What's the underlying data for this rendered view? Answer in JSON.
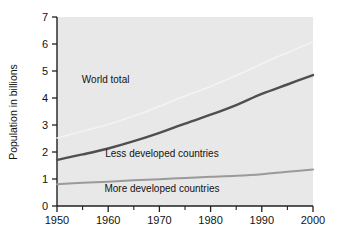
{
  "chart_data": {
    "type": "line",
    "title": "",
    "xlabel": "",
    "ylabel": "Population in billions",
    "xlim": [
      1950,
      2000
    ],
    "ylim": [
      0,
      7
    ],
    "grid": false,
    "legend_position": "inline-annotations",
    "x_tick_labels": [
      "1950",
      "1960",
      "1970",
      "1980",
      "1990",
      "2000"
    ],
    "x_major_ticks": [
      1950,
      1960,
      1970,
      1980,
      1990,
      2000
    ],
    "x_minor_ticks": [
      1955,
      1965,
      1975,
      1985,
      1995
    ],
    "y_tick_labels": [
      "0",
      "1",
      "2",
      "3",
      "4",
      "5",
      "6",
      "7"
    ],
    "y_major_ticks": [
      0,
      1,
      2,
      3,
      4,
      5,
      6,
      7
    ],
    "x": [
      1950,
      1955,
      1960,
      1965,
      1970,
      1975,
      1980,
      1985,
      1990,
      1995,
      2000
    ],
    "series": [
      {
        "name": "World total",
        "color": "#f3f3f3",
        "width": 1.6,
        "values": [
          2.52,
          2.77,
          3.02,
          3.33,
          3.69,
          4.07,
          4.43,
          4.83,
          5.27,
          5.68,
          6.08
        ],
        "label_x": 1959.5,
        "label_y": 4.55
      },
      {
        "name": "Less developed countries",
        "color": "#4f4f4f",
        "width": 2.4,
        "values": [
          1.71,
          1.91,
          2.13,
          2.4,
          2.71,
          3.05,
          3.38,
          3.74,
          4.15,
          4.5,
          4.85
        ],
        "label_x": 1970.5,
        "label_y": 1.82
      },
      {
        "name": "More developed countries",
        "color": "#9a9a9a",
        "width": 2.0,
        "values": [
          0.81,
          0.86,
          0.9,
          0.95,
          0.99,
          1.04,
          1.08,
          1.12,
          1.18,
          1.27,
          1.35
        ],
        "label_x": 1970.5,
        "label_y": 0.53
      }
    ]
  },
  "style": {
    "plot_background": "#e8e8e8",
    "axis_color": "#202020",
    "page_background": "#ffffff"
  }
}
